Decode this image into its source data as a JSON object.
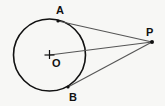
{
  "diagram": {
    "type": "geometry",
    "colors": {
      "background": "#f7f7f5",
      "circle_stroke": "#111111",
      "segment_stroke": "#555555",
      "point_fill": "#111111",
      "label": "#111111"
    },
    "circle": {
      "name": "circle-O",
      "cx": 49.5,
      "cy": 55,
      "r": 36
    },
    "points": {
      "O": {
        "label": "O",
        "x": 49.5,
        "y": 55,
        "label_x": 52,
        "label_y": 67
      },
      "A": {
        "label": "A",
        "x": 58,
        "y": 21,
        "label_x": 56,
        "label_y": 14
      },
      "B": {
        "label": "B",
        "x": 68,
        "y": 87,
        "label_x": 69,
        "label_y": 101
      },
      "P": {
        "label": "P",
        "x": 152,
        "y": 42,
        "label_x": 146,
        "label_y": 36
      }
    },
    "segments": [
      {
        "name": "PA",
        "from": "P",
        "to": "A"
      },
      {
        "name": "PO",
        "from": "P",
        "to": "O"
      },
      {
        "name": "PB",
        "from": "P",
        "to": "B"
      }
    ]
  }
}
